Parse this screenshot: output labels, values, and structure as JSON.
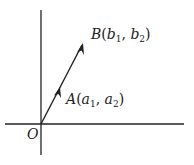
{
  "diagram": {
    "type": "vector-coordinate-plane",
    "origin_label": "O",
    "point_a": {
      "name": "A",
      "open": "(",
      "x_var": "a",
      "x_sub": "1",
      "sep": ", ",
      "y_var": "a",
      "y_sub": "2",
      "close": ")"
    },
    "point_b": {
      "name": "B",
      "open": "(",
      "x_var": "b",
      "x_sub": "1",
      "sep": ", ",
      "y_var": "b",
      "y_sub": "2",
      "close": ")"
    },
    "colors": {
      "line": "#222222",
      "background": "#ffffff"
    }
  }
}
